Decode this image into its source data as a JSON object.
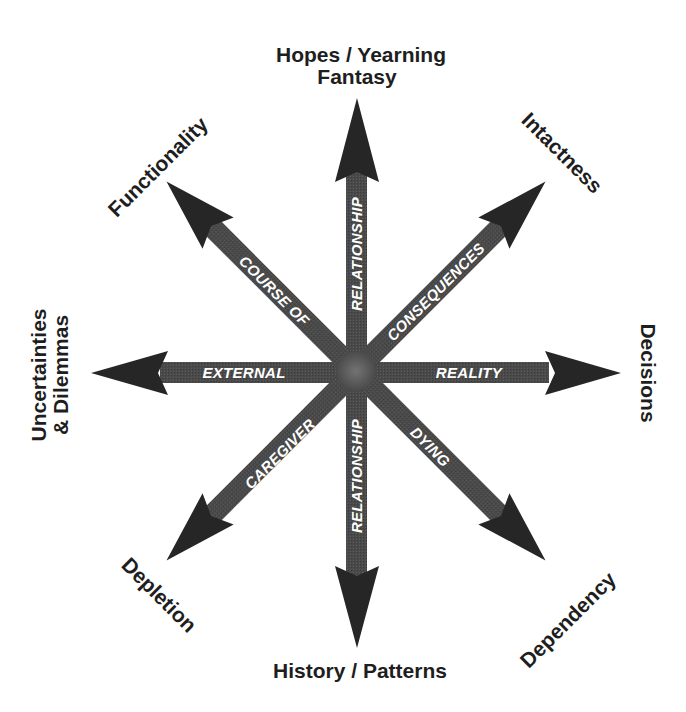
{
  "diagram": {
    "center": {
      "x": 356,
      "y": 371
    },
    "colors": {
      "shaft": "#4a4a4a",
      "head": "#262626",
      "center_hub": "#6e6e6e",
      "label_text": "#1e1e1e",
      "shaft_text": "#ffffff",
      "background": "#ffffff"
    },
    "arrows": [
      {
        "id": "up",
        "direction": "up",
        "tip": {
          "x": 357,
          "y": 98
        },
        "shaft_label": "RELATIONSHIP",
        "end_label_line1": "Hopes / Yearning",
        "end_label_line2": "Fantasy"
      },
      {
        "id": "up-right",
        "direction": "up-right",
        "tip": {
          "x": 545,
          "y": 180
        },
        "shaft_label": "CONSEQUENCES",
        "end_label_line1": "Intactness"
      },
      {
        "id": "right",
        "direction": "right",
        "tip": {
          "x": 621,
          "y": 373
        },
        "shaft_label": "REALITY",
        "end_label_line1": "Decisions"
      },
      {
        "id": "down-right",
        "direction": "down-right",
        "tip": {
          "x": 545,
          "y": 566
        },
        "shaft_label": "DYING",
        "end_label_line1": "Dependency"
      },
      {
        "id": "down",
        "direction": "down",
        "tip": {
          "x": 357,
          "y": 648
        },
        "shaft_label": "RELATIONSHIP",
        "end_label_line1": "History / Patterns"
      },
      {
        "id": "down-left",
        "direction": "down-left",
        "tip": {
          "x": 168,
          "y": 566
        },
        "shaft_label": "CAREGIVER",
        "end_label_line1": "Depletion"
      },
      {
        "id": "left",
        "direction": "left",
        "tip": {
          "x": 91,
          "y": 373
        },
        "shaft_label": "EXTERNAL",
        "end_label_line1": "Uncertainties",
        "end_label_line2": "& Dilemmas"
      },
      {
        "id": "up-left",
        "direction": "up-left",
        "tip": {
          "x": 169,
          "y": 181
        },
        "shaft_label": "COURSE OF",
        "end_label_line1": "Functionality"
      }
    ]
  }
}
